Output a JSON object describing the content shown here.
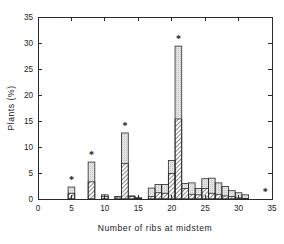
{
  "chart_data": {
    "type": "bar",
    "title": "",
    "subtitle": "",
    "xlabel": "Number of ribs at midstem",
    "ylabel": "Plants (%)",
    "xlim": [
      0,
      35
    ],
    "ylim": [
      0,
      35
    ],
    "xticks": [
      0,
      5,
      10,
      15,
      20,
      25,
      30,
      35
    ],
    "yticks": [
      0,
      5,
      10,
      15,
      20,
      25,
      30,
      35
    ],
    "xticklabels": [
      "0",
      "5",
      "10",
      "15",
      "20",
      "25",
      "30",
      "35"
    ],
    "yticklabels": [
      "0",
      "5",
      "10",
      "15",
      "20",
      "25",
      "30",
      "35"
    ],
    "grid": false,
    "legend": "none",
    "bin_width": 1,
    "categories": [
      5,
      6,
      7,
      8,
      9,
      10,
      11,
      12,
      13,
      14,
      15,
      16,
      17,
      18,
      19,
      20,
      21,
      22,
      23,
      24,
      25,
      26,
      27,
      28,
      29,
      30,
      31,
      32
    ],
    "series": [
      {
        "name": "hatched-component",
        "fill": "diagonal-hatch",
        "values": [
          1.1,
          0.0,
          0.0,
          3.3,
          0.0,
          0.5,
          0.0,
          0.4,
          6.8,
          0.5,
          0.2,
          0.0,
          0.5,
          1.2,
          1.1,
          4.9,
          15.4,
          2.0,
          0.9,
          0.8,
          2.0,
          1.1,
          0.9,
          0.6,
          0.5,
          0.2,
          0.1,
          0.0
        ]
      },
      {
        "name": "light-gray-component",
        "fill": "light-stipple",
        "values": [
          1.2,
          0.0,
          0.0,
          3.8,
          0.0,
          0.3,
          0.0,
          0.1,
          5.9,
          0.1,
          0.0,
          0.0,
          1.6,
          1.6,
          1.7,
          2.5,
          14.0,
          1.0,
          2.2,
          1.2,
          1.9,
          2.9,
          2.2,
          1.8,
          1.1,
          1.0,
          0.7,
          0.0
        ]
      }
    ],
    "totals": [
      2.3,
      0.0,
      0.0,
      7.1,
      0.0,
      0.8,
      0.0,
      0.5,
      12.7,
      0.6,
      0.2,
      0.0,
      2.1,
      2.8,
      2.8,
      7.4,
      29.4,
      3.0,
      3.1,
      2.0,
      3.9,
      4.0,
      3.1,
      2.4,
      1.6,
      1.2,
      0.8,
      0.0
    ],
    "annotations": [
      {
        "label": "*",
        "x": 5,
        "y": 2.3
      },
      {
        "label": "*",
        "x": 8,
        "y": 7.1
      },
      {
        "label": "*",
        "x": 13,
        "y": 12.7
      },
      {
        "label": "*",
        "x": 21,
        "y": 29.4
      },
      {
        "label": "*",
        "x": 34,
        "y": 0.0
      }
    ],
    "colors": {
      "axis": "#2b2b2b",
      "outline": "#2a2a2a",
      "hatch": "#555555",
      "light_fill": "#dcdcdc",
      "background": "#ffffff"
    }
  }
}
